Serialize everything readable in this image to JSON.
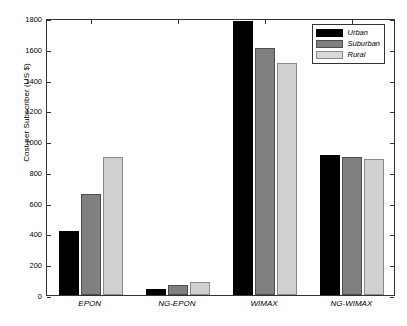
{
  "chart_data": {
    "type": "bar",
    "title": "",
    "xlabel": "",
    "ylabel": "Cost per Subscriber (US $)",
    "categories": [
      "EPON",
      "NG-EPON",
      "WIMAX",
      "NG-WIMAX"
    ],
    "series": [
      {
        "name": "Urban",
        "color": "#000000",
        "values": [
          415,
          40,
          1780,
          910
        ]
      },
      {
        "name": "Suburban",
        "color": "#808080",
        "values": [
          655,
          62,
          1605,
          895
        ]
      },
      {
        "name": "Rural",
        "color": "#d0d0d0",
        "values": [
          900,
          85,
          1505,
          885
        ]
      }
    ],
    "ylim": [
      0,
      1800
    ],
    "yticks": [
      0,
      200,
      400,
      600,
      800,
      1000,
      1200,
      1400,
      1600,
      1800
    ],
    "ytick_labels": [
      "0",
      "200",
      "400",
      "600",
      "800",
      "1000",
      "1200",
      "1400",
      "1600",
      "1800"
    ],
    "grid": false,
    "legend_position": "top-right",
    "legend_entries": [
      "Urban",
      "Suburban",
      "Rural"
    ]
  },
  "axes": {
    "y_title": "Cost per Subscriber (US $)"
  },
  "legend": {
    "items": [
      {
        "label": "Urban"
      },
      {
        "label": "Suburban"
      },
      {
        "label": "Rural"
      }
    ]
  }
}
